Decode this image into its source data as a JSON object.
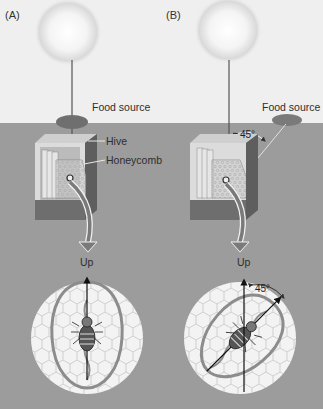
{
  "panels": [
    {
      "id": "A",
      "label": "(A)",
      "food_source_label": "Food source",
      "hive_label": "Hive",
      "honeycomb_label": "Honeycomb",
      "up_label": "Up",
      "angle_label": null,
      "dance_angle_deg": 0
    },
    {
      "id": "B",
      "label": "(B)",
      "food_source_label": "Food source",
      "hive_label": null,
      "honeycomb_label": null,
      "up_label": "Up",
      "angle_label": "45°",
      "comb_angle_label": "45°",
      "dance_angle_deg": 45
    }
  ],
  "colors": {
    "sky": "#efefef",
    "ground": "#9a9a9a",
    "hive_dark": "#6e6e6e",
    "hive_light": "#d8d8d8",
    "comb_disc": "#f2f2f2",
    "waggle_path": "#8a8a8a",
    "arrow": "#777777"
  }
}
